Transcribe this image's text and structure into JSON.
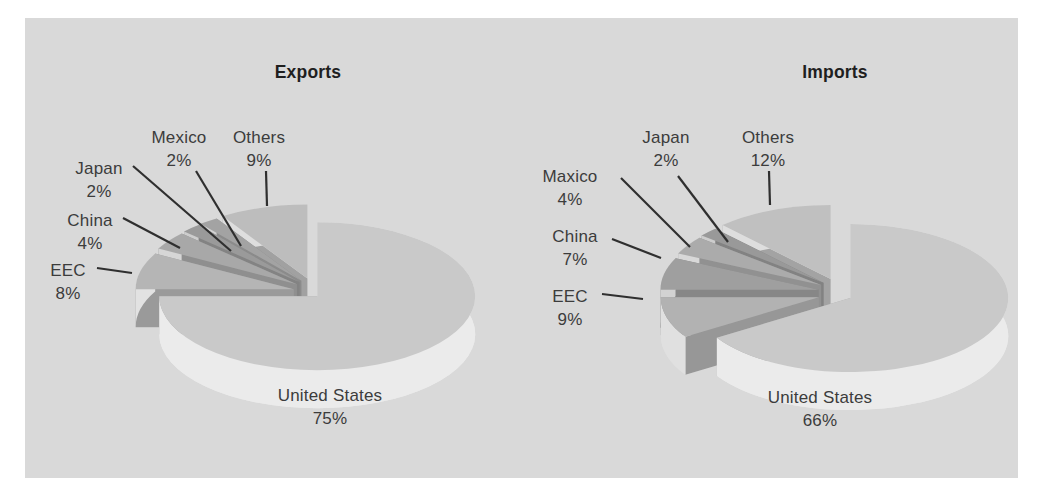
{
  "figure": {
    "background": "#ffffff",
    "panel_color": "#d9d9d9",
    "label_text_color": "#3c3c3c",
    "title_text_color": "#1f1f1f",
    "leader_line_color": "#2f2f2f"
  },
  "chart_data": [
    {
      "type": "pie",
      "style": "3d-exploded",
      "title": "Exports",
      "unit": "%",
      "categories": [
        "Others",
        "Mexico",
        "Japan",
        "China",
        "EEC",
        "United States"
      ],
      "values": [
        9,
        2,
        2,
        4,
        8,
        75
      ],
      "legend": "none",
      "geometry": {
        "cx": 313,
        "cy": 293,
        "rx": 158,
        "ry": 74,
        "depth": 38,
        "start_angle": 90,
        "direction": "ccw",
        "explode_y_scale": 0.75
      },
      "slices": [
        {
          "name": "Others",
          "value": 9,
          "pct_label": "9%",
          "top": "#bdbdbd",
          "side": "#dedede",
          "explode": 20,
          "label": {
            "x": 259,
            "y": 126
          },
          "leader": {
            "x1": 266,
            "y1": 171,
            "x2": 267,
            "y2": 206
          }
        },
        {
          "name": "Mexico",
          "value": 2,
          "pct_label": "2%",
          "top": "#a3a3a3",
          "side": "#d2d2d2",
          "explode": 20,
          "label": {
            "x": 179,
            "y": 126
          },
          "leader": {
            "x1": 196,
            "y1": 171,
            "x2": 241,
            "y2": 246
          }
        },
        {
          "name": "Japan",
          "value": 2,
          "pct_label": "2%",
          "top": "#9a9a9a",
          "side": "#cdcdcd",
          "explode": 20,
          "label": {
            "x": 99,
            "y": 157
          },
          "leader": {
            "x1": 133,
            "y1": 166,
            "x2": 231,
            "y2": 251
          }
        },
        {
          "name": "China",
          "value": 4,
          "pct_label": "4%",
          "top": "#a8a8a8",
          "side": "#d6d6d6",
          "explode": 20,
          "label": {
            "x": 90,
            "y": 209
          },
          "leader": {
            "x1": 123,
            "y1": 218,
            "x2": 180,
            "y2": 248
          }
        },
        {
          "name": "EEC",
          "value": 8,
          "pct_label": "8%",
          "top": "#b5b5b5",
          "side": "#e2e2e2",
          "explode": 20,
          "label": {
            "x": 68,
            "y": 259
          },
          "leader": {
            "x1": 97,
            "y1": 268,
            "x2": 132,
            "y2": 273
          }
        },
        {
          "name": "United States",
          "value": 75,
          "pct_label": "75%",
          "top": "#c9c9c9",
          "side": "#ebebeb",
          "explode": 6,
          "label": {
            "x": 330,
            "y": 384
          },
          "leader": null
        }
      ]
    },
    {
      "type": "pie",
      "style": "3d-exploded",
      "title": "Imports",
      "unit": "%",
      "categories": [
        "Others",
        "Japan",
        "Maxico",
        "China",
        "EEC",
        "United States"
      ],
      "values": [
        12,
        2,
        4,
        7,
        9,
        66
      ],
      "legend": "none",
      "geometry": {
        "cx": 838,
        "cy": 293,
        "rx": 158,
        "ry": 74,
        "depth": 38,
        "start_angle": 90,
        "direction": "ccw",
        "explode_y_scale": 0.75
      },
      "slices": [
        {
          "name": "Others",
          "value": 12,
          "pct_label": "12%",
          "top": "#c0c0c0",
          "side": "#dedede",
          "explode": 20,
          "label": {
            "x": 768,
            "y": 126
          },
          "leader": {
            "x1": 769,
            "y1": 171,
            "x2": 770,
            "y2": 205
          }
        },
        {
          "name": "Japan",
          "value": 2,
          "pct_label": "2%",
          "top": "#999999",
          "side": "#cdcdcd",
          "explode": 20,
          "label": {
            "x": 666,
            "y": 126
          },
          "leader": {
            "x1": 678,
            "y1": 176,
            "x2": 728,
            "y2": 242
          }
        },
        {
          "name": "Maxico",
          "value": 4,
          "pct_label": "4%",
          "top": "#ababab",
          "side": "#d8d8d8",
          "explode": 20,
          "label": {
            "x": 570,
            "y": 165
          },
          "leader": {
            "x1": 621,
            "y1": 178,
            "x2": 690,
            "y2": 247
          }
        },
        {
          "name": "China",
          "value": 7,
          "pct_label": "7%",
          "top": "#9f9f9f",
          "side": "#d2d2d2",
          "explode": 20,
          "label": {
            "x": 575,
            "y": 225
          },
          "leader": {
            "x1": 612,
            "y1": 239,
            "x2": 661,
            "y2": 258
          }
        },
        {
          "name": "EEC",
          "value": 9,
          "pct_label": "9%",
          "top": "#b2b2b2",
          "side": "#e0e0e0",
          "explode": 20,
          "label": {
            "x": 570,
            "y": 285
          },
          "leader": {
            "x1": 602,
            "y1": 294,
            "x2": 643,
            "y2": 299
          }
        },
        {
          "name": "United States",
          "value": 66,
          "pct_label": "66%",
          "top": "#c9c9c9",
          "side": "#ebebeb",
          "explode": 14,
          "label": {
            "x": 820,
            "y": 386
          },
          "leader": null
        }
      ]
    }
  ]
}
